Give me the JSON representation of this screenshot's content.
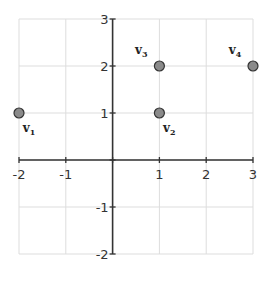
{
  "chart_data": {
    "type": "scatter",
    "title": "",
    "xlabel": "",
    "ylabel": "",
    "xlim": [
      -2,
      3
    ],
    "ylim": [
      -2,
      3
    ],
    "grid": true,
    "x_ticks": [
      "-2",
      "-1",
      "1",
      "2",
      "3"
    ],
    "y_ticks": [
      "3",
      "2",
      "1",
      "-1",
      "-2"
    ],
    "points": [
      {
        "label": "v",
        "sub": "1",
        "x": -2,
        "y": 1
      },
      {
        "label": "v",
        "sub": "2",
        "x": 1,
        "y": 1
      },
      {
        "label": "v",
        "sub": "3",
        "x": 1,
        "y": 2
      },
      {
        "label": "v",
        "sub": "4",
        "x": 3,
        "y": 2
      }
    ],
    "point_color": "#8a8a8a",
    "point_stroke": "#333333",
    "grid_color": "#dddddd",
    "axis_color": "#333333"
  }
}
